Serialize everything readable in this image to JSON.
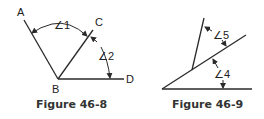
{
  "figures": [
    {
      "caption": "Figure 46-8",
      "points": {
        "A": "A",
        "B": "B",
        "C": "C",
        "D": "D"
      },
      "angles": {
        "angle1": "∠1",
        "angle2": "∠2"
      }
    },
    {
      "caption": "Figure 46-9",
      "angles": {
        "angle5": "∠5",
        "angle4": "∠4"
      }
    }
  ],
  "colors": {
    "line": "#2a2a2a",
    "text": "#222222",
    "background": "#ffffff"
  }
}
